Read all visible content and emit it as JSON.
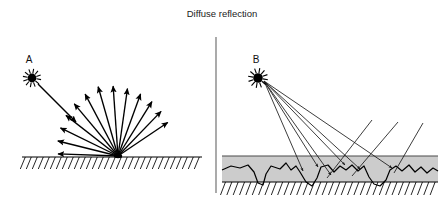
{
  "figure": {
    "title": "Diffuse reflection",
    "background_color": "#ffffff",
    "ink_color": "#000000",
    "divider_color": "#7d7d7d",
    "material_fill": "#cccccc",
    "material_stroke": "#555555"
  },
  "panels": [
    {
      "id": "left-panel",
      "name": "smooth-surface-panel",
      "source": {
        "label": "A",
        "icon": "star-burst-light-source",
        "x": 32,
        "y": 78,
        "label_x": 29,
        "label_y": 63
      },
      "incident_ray": {
        "name": "incident-ray-arrow",
        "from_x": 38,
        "from_y": 84,
        "to_x": 76,
        "to_y": 122
      },
      "scatter_origin": {
        "x": 118,
        "y": 156
      },
      "scatter_ray_count": 13,
      "scatter_angles_deg": [
        178,
        166,
        154,
        142,
        130,
        118,
        106,
        94,
        82,
        70,
        58,
        46,
        34
      ],
      "scatter_lengths": [
        60,
        62,
        64,
        66,
        68,
        70,
        72,
        70,
        68,
        66,
        64,
        62,
        60
      ],
      "ground": {
        "name": "hatched-ground-line",
        "line_y": 157,
        "x_start": 22,
        "x_end": 202,
        "hatch_count": 30,
        "hatch_dx": -5,
        "hatch_dy": 12
      }
    },
    {
      "id": "right-panel",
      "name": "rough-surface-panel",
      "source": {
        "label": "B",
        "icon": "star-burst-light-source",
        "x": 258,
        "y": 78,
        "label_x": 256,
        "label_y": 63
      },
      "incident_rays": [
        {
          "to_x": 303,
          "to_y": 171
        },
        {
          "to_x": 318,
          "to_y": 167
        },
        {
          "to_x": 331,
          "to_y": 175
        },
        {
          "to_x": 345,
          "to_y": 165
        },
        {
          "to_x": 360,
          "to_y": 169
        },
        {
          "to_x": 392,
          "to_y": 168
        }
      ],
      "outgoing_rays": [
        {
          "from_x": 327,
          "from_y": 178,
          "to_x": 372,
          "to_y": 120
        },
        {
          "from_x": 352,
          "from_y": 176,
          "to_x": 398,
          "to_y": 122
        },
        {
          "from_x": 394,
          "from_y": 173,
          "to_x": 423,
          "to_y": 123
        }
      ],
      "material_band": {
        "name": "rough-material-band",
        "x_start": 222,
        "x_end": 438,
        "top_y": 156,
        "bottom_y": 182,
        "fill": "#cccccc"
      },
      "rough_profile_points": "222,170 231,166 240,168 248,165 254,172 258,183 263,185 266,174 271,166 280,169 286,163 291,170 296,166 300,172 306,182 312,186 317,178 321,167 328,165 334,172 340,166 346,170 352,165 358,171 364,166 369,177 374,184 380,186 386,180 390,170 396,166 402,171 409,165 415,172 421,167 427,173 433,168 438,171",
      "ground": {
        "name": "hatched-ground-line",
        "line_y": 182,
        "x_start": 222,
        "x_end": 438,
        "hatch_count": 34,
        "hatch_dx": -5,
        "hatch_dy": 13
      }
    }
  ],
  "divider": {
    "name": "panel-divider",
    "x": 216,
    "y_top": 37,
    "y_bottom": 193
  }
}
